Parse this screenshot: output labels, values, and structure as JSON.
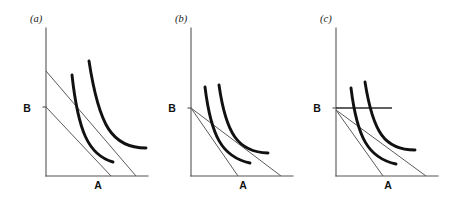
{
  "figure": {
    "background_color": "#ffffff",
    "width": 449,
    "height": 198,
    "axis_color": "#555555",
    "budget_line_color": "#5a5a5a",
    "indifference_curve_color": "#111111"
  },
  "chart_data": {
    "type": "line",
    "title": "",
    "xlabel": "A",
    "ylabel": "B",
    "grid": false,
    "legend": "none",
    "panels": [
      {
        "tag": "(a)",
        "tag_x": 30,
        "tag_y": 22,
        "origin": {
          "x": 46,
          "y": 176
        },
        "y_axis_top": 28,
        "x_axis_right": 148,
        "x_label": "A",
        "x_label_x": 98,
        "x_label_y": 189,
        "y_label": "B",
        "y_label_x": 27,
        "y_label_y": 112,
        "y_label_tick_y": 107,
        "budget_lines": [
          {
            "name": "outer-budget-line",
            "x1": 46,
            "y1": 71,
            "x2": 136,
            "y2": 176
          },
          {
            "name": "inner-budget-line",
            "x1": 46,
            "y1": 107,
            "x2": 111,
            "y2": 176
          }
        ],
        "kink_segments": [],
        "indifference_curves": [
          {
            "name": "lower-indifference-curve",
            "start": [
              72,
              75
            ],
            "c1": [
              78,
              130
            ],
            "c2": [
              88,
              155
            ],
            "end": [
              113,
              162
            ]
          },
          {
            "name": "upper-indifference-curve",
            "start": [
              89,
              61
            ],
            "c1": [
              99,
              126
            ],
            "c2": [
              112,
              148
            ],
            "end": [
              146,
              148
            ]
          }
        ]
      },
      {
        "tag": "(b)",
        "tag_x": 175,
        "tag_y": 22,
        "origin": {
          "x": 191,
          "y": 176
        },
        "y_axis_top": 28,
        "x_axis_right": 293,
        "x_label": "A",
        "x_label_x": 243,
        "x_label_y": 189,
        "y_label": "B",
        "y_label_x": 172,
        "y_label_y": 112,
        "y_label_tick_y": 108,
        "budget_lines": [
          {
            "name": "outer-budget-line",
            "x1": 191,
            "y1": 108,
            "x2": 281,
            "y2": 176
          },
          {
            "name": "inner-budget-line",
            "x1": 191,
            "y1": 108,
            "x2": 238,
            "y2": 176
          }
        ],
        "kink_segments": [],
        "indifference_curves": [
          {
            "name": "lower-indifference-curve",
            "start": [
              205,
              87
            ],
            "c1": [
              211,
              136
            ],
            "c2": [
              222,
              157
            ],
            "end": [
              250,
              163
            ]
          },
          {
            "name": "upper-indifference-curve",
            "start": [
              219,
              85
            ],
            "c1": [
              226,
              134
            ],
            "c2": [
              238,
              152
            ],
            "end": [
              268,
              153
            ]
          }
        ]
      },
      {
        "tag": "(c)",
        "tag_x": 320,
        "tag_y": 22,
        "origin": {
          "x": 336,
          "y": 176
        },
        "y_axis_top": 28,
        "x_axis_right": 438,
        "x_label": "A",
        "x_label_x": 388,
        "x_label_y": 189,
        "y_label": "B",
        "y_label_x": 317,
        "y_label_y": 112,
        "y_label_tick_y": 108,
        "budget_lines": [
          {
            "name": "outer-budget-line",
            "x1": 336,
            "y1": 110,
            "x2": 426,
            "y2": 176
          },
          {
            "name": "inner-budget-line",
            "x1": 336,
            "y1": 110,
            "x2": 383,
            "y2": 176
          }
        ],
        "kink_segments": [
          {
            "name": "horizontal-ration-line",
            "x1": 336,
            "y1": 108,
            "x2": 392,
            "y2": 108
          }
        ],
        "indifference_curves": [
          {
            "name": "lower-indifference-curve",
            "start": [
              351,
              88
            ],
            "c1": [
              357,
              137
            ],
            "c2": [
              368,
              158
            ],
            "end": [
              396,
              164
            ]
          },
          {
            "name": "upper-indifference-curve",
            "start": [
              365,
              82
            ],
            "c1": [
              373,
              133
            ],
            "c2": [
              385,
              150
            ],
            "end": [
              415,
              150
            ]
          }
        ]
      }
    ]
  }
}
